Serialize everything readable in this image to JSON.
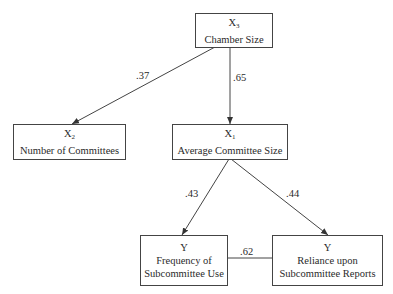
{
  "nodes": {
    "x3": {
      "var": "X",
      "sub": "3",
      "label": "Chamber Size"
    },
    "x2": {
      "var": "X",
      "sub": "2",
      "label": "Number of Committees"
    },
    "x1": {
      "var": "X",
      "sub": "1",
      "label": "Average Committee Size"
    },
    "y_freq": {
      "var": "Y",
      "label_line1": "Frequency of",
      "label_line2": "Subcommittee Use"
    },
    "y_rel": {
      "var": "Y",
      "label_line1": "Reliance upon",
      "label_line2": "Subcommittee Reports"
    }
  },
  "edges": {
    "x3_x2": ".37",
    "x3_x1": ".65",
    "x1_yfreq": ".43",
    "x1_yrel": ".44",
    "yfreq_yrel": ".62"
  }
}
